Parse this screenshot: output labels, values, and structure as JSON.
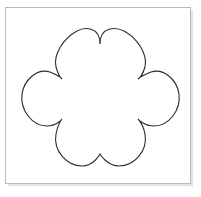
{
  "canvas": {
    "width": 201,
    "height": 197,
    "background_color": "#ffffff",
    "title": "Flower Outline Shape"
  },
  "frame": {
    "name": "image-frame",
    "x": 5,
    "y": 7,
    "width": 186,
    "height": 177,
    "border_color": "#b9b9b9",
    "border_width": 1,
    "fill_color": "#ffffff",
    "shadow_color": "#e3e3e3"
  },
  "shape": {
    "name": "flower-outline",
    "label": "Six petal flower outline",
    "stroke_color": "#2b2b2b",
    "fill_color": "#ffffff",
    "stroke_width": 1.1,
    "bounds": {
      "left": 22,
      "top": 32,
      "right": 178,
      "bottom": 166
    },
    "center": {
      "x": 100,
      "y": 99
    },
    "petal_count": 6,
    "petals": [
      {
        "name": "petal-top-left",
        "cx": 77,
        "cy": 59,
        "r": 28
      },
      {
        "name": "petal-top-right",
        "cx": 123,
        "cy": 59,
        "r": 28
      },
      {
        "name": "petal-left",
        "cx": 50,
        "cy": 99,
        "r": 28
      },
      {
        "name": "petal-right",
        "cx": 150,
        "cy": 99,
        "r": 28
      },
      {
        "name": "petal-bottom-left",
        "cx": 77,
        "cy": 139,
        "r": 28
      },
      {
        "name": "petal-bottom-right",
        "cx": 123,
        "cy": 139,
        "r": 28
      }
    ],
    "notches": [
      {
        "name": "notch-top-center",
        "x": 100,
        "y": 44
      },
      {
        "name": "notch-upper-left",
        "x": 62,
        "y": 79
      },
      {
        "name": "notch-upper-right",
        "x": 138,
        "y": 79
      },
      {
        "name": "notch-lower-left",
        "x": 62,
        "y": 119
      },
      {
        "name": "notch-lower-right",
        "x": 138,
        "y": 119
      },
      {
        "name": "notch-bottom-center",
        "x": 100,
        "y": 154
      }
    ],
    "path": "M 100 44 C 100 26 84 27 77 31 C 64 38 53 54 56 67 C 59 77 62 79 62 79 C 62 79 60 76 50 72 C 37 68 24 80 22 94 C 20 110 32 126 47 126 C 57 126 62 119 62 119 C 62 119 58 124 56 134 C 53 151 67 166 82 166 C 94 166 100 154 100 154 C 100 154 107 166 119 166 C 134 166 148 151 145 134 C 143 124 138 119 138 119 C 138 119 144 126 154 126 C 169 126 181 110 179 94 C 177 80 164 68 151 72 C 141 76 138 79 138 79 C 138 79 142 77 145 67 C 148 54 137 38 124 31 C 116 27 100 26 100 44 Z"
  }
}
